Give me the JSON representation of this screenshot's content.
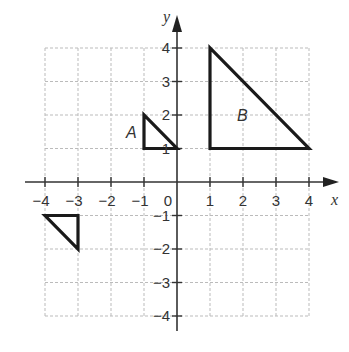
{
  "diagram": {
    "type": "coordinate-plane",
    "axes": {
      "x_label": "x",
      "y_label": "y",
      "x_range": [
        -4,
        4
      ],
      "y_range": [
        -4,
        4
      ],
      "x_ticks": [
        "-4",
        "-3",
        "-2",
        "-1",
        "0",
        "1",
        "2",
        "3",
        "4"
      ],
      "y_ticks": [
        "4",
        "3",
        "2",
        "1",
        "-1",
        "-2",
        "-3",
        "-4"
      ],
      "origin_label": "0"
    },
    "grid": {
      "style": "dashed",
      "color": "#bbbbbb"
    },
    "shapes": [
      {
        "label": "A",
        "vertices": [
          [
            -1,
            2
          ],
          [
            -1,
            1
          ],
          [
            0,
            1
          ]
        ]
      },
      {
        "label": "B",
        "vertices": [
          [
            1,
            4
          ],
          [
            1,
            1
          ],
          [
            4,
            1
          ]
        ]
      },
      {
        "label": "",
        "vertices": [
          [
            -4,
            -1
          ],
          [
            -3,
            -1
          ],
          [
            -3,
            -2
          ]
        ]
      }
    ]
  }
}
